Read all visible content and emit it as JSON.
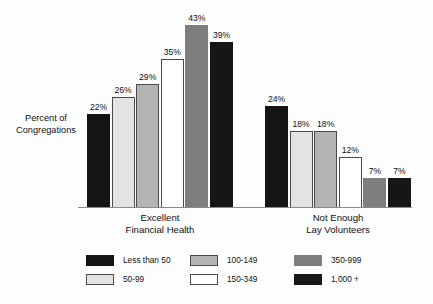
{
  "chart_data": {
    "type": "bar",
    "title": "",
    "subtitle": "",
    "xlabel": "",
    "ylabel": "Percent of Congregations",
    "ylim": [
      0,
      45
    ],
    "grid": false,
    "legend_position": "bottom",
    "value_suffix": "%",
    "categories": [
      "Excellent Financial Health",
      "Not Enough Lay Volunteers"
    ],
    "series": [
      {
        "name": "Less than 50",
        "color": "#151515",
        "values": [
          22,
          24
        ]
      },
      {
        "name": "50-99",
        "color": "#e3e3e3",
        "values": [
          26,
          18
        ]
      },
      {
        "name": "100-149",
        "color": "#b4b4b4",
        "values": [
          29,
          18
        ]
      },
      {
        "name": "150-349",
        "color": "#ffffff",
        "values": [
          35,
          12
        ]
      },
      {
        "name": "350-999",
        "color": "#7e7e7e",
        "values": [
          43,
          7
        ]
      },
      {
        "name": "1,000 +",
        "color": "#161616",
        "values": [
          39,
          7
        ]
      }
    ]
  },
  "axis": {
    "y_title_line1": "Percent of",
    "y_title_line2": "Congregations"
  },
  "groups": [
    {
      "caption_line1": "Excellent",
      "caption_line2": "Financial Health"
    },
    {
      "caption_line1": "Not Enough",
      "caption_line2": "Lay Volunteers"
    }
  ],
  "bars": {
    "g0": [
      {
        "label": "22%",
        "series": "Less than 50"
      },
      {
        "label": "26%",
        "series": "50-99"
      },
      {
        "label": "29%",
        "series": "100-149"
      },
      {
        "label": "35%",
        "series": "150-349"
      },
      {
        "label": "43%",
        "series": "350-999"
      },
      {
        "label": "39%",
        "series": "1,000 +"
      }
    ],
    "g1": [
      {
        "label": "24%",
        "series": "Less than 50"
      },
      {
        "label": "18%",
        "series": "50-99"
      },
      {
        "label": "18%",
        "series": "100-149"
      },
      {
        "label": "12%",
        "series": "150-349"
      },
      {
        "label": "7%",
        "series": "350-999"
      },
      {
        "label": "7%",
        "series": "1,000 +"
      }
    ]
  },
  "legend": {
    "rows": [
      [
        {
          "label": "Less than 50",
          "color": "#151515"
        },
        {
          "label": "100-149",
          "color": "#b4b4b4"
        },
        {
          "label": "350-999",
          "color": "#7e7e7e"
        }
      ],
      [
        {
          "label": "50-99",
          "color": "#e3e3e3"
        },
        {
          "label": "150-349",
          "color": "#ffffff"
        },
        {
          "label": "1,000 +",
          "color": "#161616"
        }
      ]
    ]
  },
  "style": {
    "baseline_color": "#8a8a8a",
    "outline_color": "#4a4a4a",
    "text_color": "#111111",
    "background": "#fdfdfd"
  }
}
